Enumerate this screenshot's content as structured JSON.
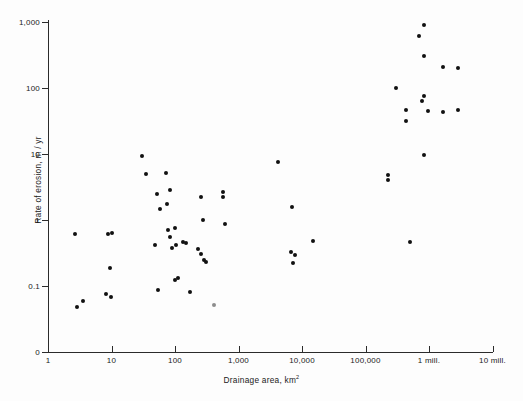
{
  "figure": {
    "title": "",
    "background_color": "#fdfdfd",
    "marker_color": "#111111",
    "axis_color": "#2b2b2b"
  },
  "axes": {
    "x_title_text": "Drainage area, km",
    "x_title_superscript": "2",
    "y_title": "Rate of erosion, m / yr",
    "x_ticks": [
      {
        "label": "1",
        "value": 1,
        "px": 48
      },
      {
        "label": "10",
        "value": 10,
        "px": 111.5
      },
      {
        "label": "100",
        "value": 100,
        "px": 175
      },
      {
        "label": "1,000",
        "value": 1000,
        "px": 238.5
      },
      {
        "label": "10,000",
        "value": 10000,
        "px": 302
      },
      {
        "label": "100,000",
        "value": 100000,
        "px": 365.5
      },
      {
        "label": "1 mill.",
        "value": 1000000,
        "px": 429
      },
      {
        "label": "10 mill.",
        "value": 10000000,
        "px": 492.5
      }
    ],
    "y_ticks": [
      {
        "label": "1,000",
        "value": 1000,
        "px": 22
      },
      {
        "label": "100",
        "value": 100,
        "px": 88
      },
      {
        "label": "10",
        "value": 10,
        "px": 154
      },
      {
        "label": "1",
        "value": 1,
        "px": 220
      },
      {
        "label": "0.1",
        "value": 0.1,
        "px": 286
      },
      {
        "label": "0",
        "value": 0,
        "px": 352
      }
    ]
  },
  "chart_data": {
    "type": "scatter",
    "title": "",
    "xlabel": "Drainage area, km2",
    "ylabel": "Rate of erosion, m / yr",
    "xscale": "log",
    "yscale": "log",
    "xlim": [
      1,
      10000000
    ],
    "ylim": [
      0.04,
      1000
    ],
    "grid": false,
    "legend": null,
    "series": [
      {
        "name": "Rate of erosion vs drainage area",
        "marker": "filled-circle",
        "color": "#111111",
        "points": [
          {
            "x": 3.0,
            "y": 0.62
          },
          {
            "x": 3.3,
            "y": 0.052
          },
          {
            "x": 4.3,
            "y": 0.065
          },
          {
            "x": 8.6,
            "y": 0.6
          },
          {
            "x": 9.5,
            "y": 0.6
          },
          {
            "x": 9.0,
            "y": 0.19
          },
          {
            "x": 8.3,
            "y": 0.083
          },
          {
            "x": 9.8,
            "y": 0.077
          },
          {
            "x": 30,
            "y": 9.2
          },
          {
            "x": 35,
            "y": 2.7
          },
          {
            "x": 55,
            "y": 1.35
          },
          {
            "x": 62,
            "y": 0.81
          },
          {
            "x": 52,
            "y": 0.28
          },
          {
            "x": 58,
            "y": 0.086
          },
          {
            "x": 85,
            "y": 5.0
          },
          {
            "x": 98,
            "y": 3.1
          },
          {
            "x": 88,
            "y": 1.9
          },
          {
            "x": 92,
            "y": 0.7
          },
          {
            "x": 120,
            "y": 0.77
          },
          {
            "x": 100,
            "y": 0.56
          },
          {
            "x": 125,
            "y": 0.54
          },
          {
            "x": 105,
            "y": 0.42
          },
          {
            "x": 130,
            "y": 0.145
          },
          {
            "x": 118,
            "y": 0.135
          },
          {
            "x": 150,
            "y": 0.46
          },
          {
            "x": 165,
            "y": 0.44
          },
          {
            "x": 180,
            "y": 0.094
          },
          {
            "x": 260,
            "y": 2.25
          },
          {
            "x": 270,
            "y": 1.0
          },
          {
            "x": 230,
            "y": 0.36
          },
          {
            "x": 260,
            "y": 0.3
          },
          {
            "x": 275,
            "y": 0.24
          },
          {
            "x": 285,
            "y": 0.23
          },
          {
            "x": 380,
            "y": 0.056
          },
          {
            "x": 580,
            "y": 2.7
          },
          {
            "x": 590,
            "y": 2.45
          },
          {
            "x": 620,
            "y": 0.88
          },
          {
            "x": 5500,
            "y": 7.0
          },
          {
            "x": 8800,
            "y": 1.45
          },
          {
            "x": 8500,
            "y": 0.33
          },
          {
            "x": 9800,
            "y": 0.3
          },
          {
            "x": 9300,
            "y": 0.25
          },
          {
            "x": 17000,
            "y": 0.47
          },
          {
            "x": 200000,
            "y": 4.4
          },
          {
            "x": 200000,
            "y": 4.0
          },
          {
            "x": 270000,
            "y": 80
          },
          {
            "x": 400000,
            "y": 36
          },
          {
            "x": 400000,
            "y": 27
          },
          {
            "x": 560000,
            "y": 0.52
          },
          {
            "x": 780000,
            "y": 220
          },
          {
            "x": 950000,
            "y": 760
          },
          {
            "x": 950000,
            "y": 230
          },
          {
            "x": 950000,
            "y": 56
          },
          {
            "x": 900000,
            "y": 40
          },
          {
            "x": 1100000,
            "y": 44
          },
          {
            "x": 1000000,
            "y": 9.6
          },
          {
            "x": 1900000,
            "y": 145
          },
          {
            "x": 1900000,
            "y": 43
          },
          {
            "x": 3300000,
            "y": 185
          },
          {
            "x": 3300000,
            "y": 47
          }
        ]
      }
    ]
  },
  "rendered_points": [
    {
      "px": 75,
      "py": 234,
      "faint": false
    },
    {
      "px": 77,
      "py": 307,
      "faint": false
    },
    {
      "px": 83,
      "py": 301,
      "faint": false
    },
    {
      "px": 108,
      "py": 234,
      "faint": false
    },
    {
      "px": 112,
      "py": 233,
      "faint": false
    },
    {
      "px": 110,
      "py": 268,
      "faint": false
    },
    {
      "px": 106,
      "py": 294,
      "faint": false
    },
    {
      "px": 111,
      "py": 297,
      "faint": false
    },
    {
      "px": 142,
      "py": 156,
      "faint": false
    },
    {
      "px": 146,
      "py": 174,
      "faint": false
    },
    {
      "px": 157,
      "py": 194,
      "faint": false
    },
    {
      "px": 160,
      "py": 209,
      "faint": false
    },
    {
      "px": 155,
      "py": 245,
      "faint": false
    },
    {
      "px": 158,
      "py": 290,
      "faint": false
    },
    {
      "px": 166,
      "py": 173,
      "faint": false
    },
    {
      "px": 170,
      "py": 190,
      "faint": false
    },
    {
      "px": 167,
      "py": 204,
      "faint": false
    },
    {
      "px": 168,
      "py": 230,
      "faint": false
    },
    {
      "px": 175,
      "py": 228,
      "faint": false
    },
    {
      "px": 170,
      "py": 237,
      "faint": false
    },
    {
      "px": 176,
      "py": 245,
      "faint": false
    },
    {
      "px": 172,
      "py": 248,
      "faint": false
    },
    {
      "px": 178,
      "py": 278,
      "faint": false
    },
    {
      "px": 175,
      "py": 280,
      "faint": false
    },
    {
      "px": 183,
      "py": 242,
      "faint": false
    },
    {
      "px": 186,
      "py": 243,
      "faint": false
    },
    {
      "px": 190,
      "py": 292,
      "faint": false
    },
    {
      "px": 201,
      "py": 197,
      "faint": false
    },
    {
      "px": 203,
      "py": 220,
      "faint": false
    },
    {
      "px": 198,
      "py": 249,
      "faint": false
    },
    {
      "px": 201,
      "py": 254,
      "faint": false
    },
    {
      "px": 204,
      "py": 260,
      "faint": false
    },
    {
      "px": 206,
      "py": 262,
      "faint": false
    },
    {
      "px": 214,
      "py": 305,
      "faint": true
    },
    {
      "px": 223,
      "py": 192,
      "faint": false
    },
    {
      "px": 223,
      "py": 197,
      "faint": false
    },
    {
      "px": 225,
      "py": 224,
      "faint": false
    },
    {
      "px": 278,
      "py": 162,
      "faint": false
    },
    {
      "px": 292,
      "py": 207,
      "faint": false
    },
    {
      "px": 291,
      "py": 252,
      "faint": false
    },
    {
      "px": 295,
      "py": 255,
      "faint": false
    },
    {
      "px": 293,
      "py": 263,
      "faint": false
    },
    {
      "px": 313,
      "py": 241,
      "faint": false
    },
    {
      "px": 388,
      "py": 175,
      "faint": false
    },
    {
      "px": 388,
      "py": 180,
      "faint": false
    },
    {
      "px": 396,
      "py": 88,
      "faint": false
    },
    {
      "px": 406,
      "py": 110,
      "faint": false
    },
    {
      "px": 406,
      "py": 121,
      "faint": false
    },
    {
      "px": 410,
      "py": 242,
      "faint": false
    },
    {
      "px": 419,
      "py": 36,
      "faint": false
    },
    {
      "px": 424,
      "py": 25,
      "faint": false
    },
    {
      "px": 424,
      "py": 56,
      "faint": false
    },
    {
      "px": 424,
      "py": 96,
      "faint": false
    },
    {
      "px": 422,
      "py": 101,
      "faint": false
    },
    {
      "px": 428,
      "py": 111,
      "faint": false
    },
    {
      "px": 424,
      "py": 155,
      "faint": false
    },
    {
      "px": 443,
      "py": 67,
      "faint": false
    },
    {
      "px": 443,
      "py": 112,
      "faint": false
    },
    {
      "px": 458,
      "py": 68,
      "faint": false
    },
    {
      "px": 458,
      "py": 110,
      "faint": false
    }
  ]
}
